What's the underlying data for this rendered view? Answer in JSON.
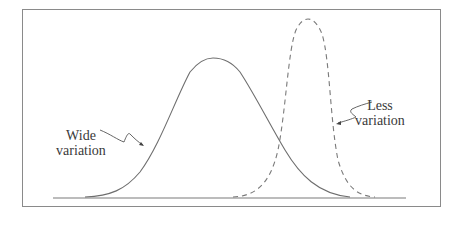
{
  "diagram": {
    "title": "",
    "baseline": {
      "x1": 53,
      "x2": 406,
      "y": 198
    },
    "colors": {
      "frame": "#8a8a8a",
      "curve": "#6e6e6e",
      "text": "#3a3a3a",
      "background": "#ffffff"
    },
    "curves": [
      {
        "name": "wide-variation-curve",
        "style": "solid",
        "start_x": 85,
        "peak_x": 213,
        "peak_y": 58,
        "end_x": 350
      },
      {
        "name": "less-variation-curve",
        "style": "dashed",
        "start_x": 233,
        "peak_x": 308,
        "peak_y": 19,
        "end_x": 375
      }
    ],
    "labels": {
      "wide": {
        "line1": "Wide",
        "line2": "variation"
      },
      "less": {
        "line1": "Less",
        "line2": "variation"
      }
    }
  }
}
